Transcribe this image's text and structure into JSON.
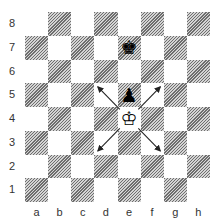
{
  "diagram": {
    "ranks": [
      "8",
      "7",
      "6",
      "5",
      "4",
      "3",
      "2",
      "1"
    ],
    "files": [
      "a",
      "b",
      "c",
      "d",
      "e",
      "f",
      "g",
      "h"
    ],
    "pieces": [
      {
        "square": "e7",
        "piece": "black-king",
        "glyph": "♚"
      },
      {
        "square": "e5",
        "piece": "black-pawn",
        "glyph": "♟"
      },
      {
        "square": "e4",
        "piece": "white-king",
        "glyph": "♔"
      }
    ],
    "arrows": [
      {
        "from": "e4",
        "to": "d5"
      },
      {
        "from": "e4",
        "to": "f5"
      },
      {
        "from": "e4",
        "to": "d3"
      },
      {
        "from": "e4",
        "to": "f3"
      }
    ],
    "colors": {
      "dark_hatch": "#6e6e6e",
      "light": "#ffffff",
      "border": "#8a8a8a",
      "arrow": "#222222"
    }
  }
}
